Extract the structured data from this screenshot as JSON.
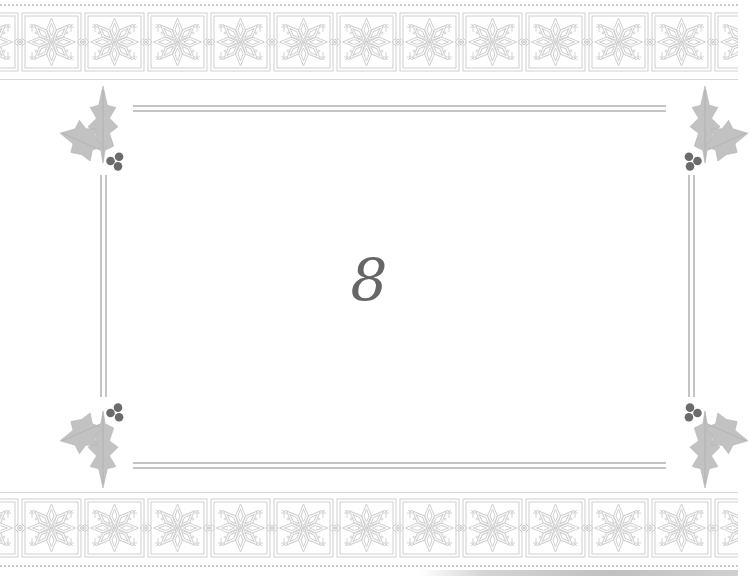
{
  "card": {
    "center_text": "8",
    "theme": "holiday-holly-frame",
    "colors": {
      "background": "#ffffff",
      "pattern": "#cfcfcf",
      "frame_line": "#c4c4c4",
      "holly_leaf": "#c2c2c2",
      "berry": "#6b6b6b",
      "text": "#666666"
    },
    "decorations": {
      "top_band": {
        "motif": "nordic-snowflake",
        "repeat_count": 12
      },
      "bottom_band": {
        "motif": "nordic-snowflake",
        "repeat_count": 12
      },
      "corners": [
        "holly-top-left",
        "holly-top-right",
        "holly-bottom-left",
        "holly-bottom-right"
      ]
    }
  }
}
